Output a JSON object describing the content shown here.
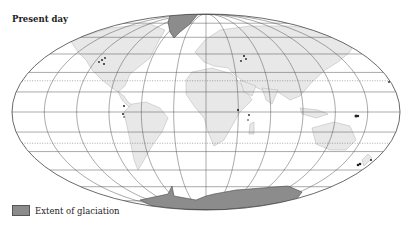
{
  "title": "Present day",
  "legend": {
    "label": "Extent of glaciation",
    "swatch_color": "#8c8c8c"
  },
  "map": {
    "projection": "mollweide",
    "center_x": 206,
    "center_y": 112,
    "radius_x": 194,
    "radius_y": 98,
    "meridian_step_deg": 30,
    "parallel_step_deg": 15,
    "dotted_parallels_deg": [
      23.5,
      -23.5
    ],
    "colors": {
      "ocean": "#ffffff",
      "land": "#e8e8e8",
      "land_outline": "#b5b5b5",
      "grid": "#555555",
      "glaciation": "#8c8c8c",
      "glaciation_outline": "#4a4a4a",
      "outline": "#444444"
    },
    "glaciated_regions": [
      {
        "name": "Greenland ice sheet"
      },
      {
        "name": "Antarctic ice sheet"
      }
    ],
    "small_glaciers": [
      {
        "region": "Rocky Mountains"
      },
      {
        "region": "Andes"
      },
      {
        "region": "Alps"
      },
      {
        "region": "East African highlands"
      },
      {
        "region": "New Guinea"
      },
      {
        "region": "New Zealand"
      },
      {
        "region": "Pacific island"
      }
    ]
  }
}
